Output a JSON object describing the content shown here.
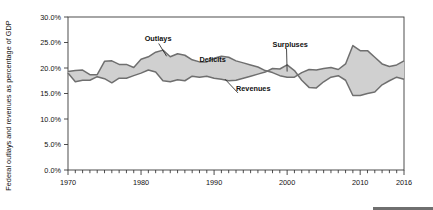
{
  "chart_data": {
    "type": "area",
    "title": "",
    "subtitle": "",
    "xlabel": "",
    "ylabel": "Federal outlays and revenues as percentage of GDP",
    "xlim": [
      1970,
      2016
    ],
    "ylim": [
      0.0,
      30.0
    ],
    "yticks": [
      "0.0%",
      "5.0%",
      "10.0%",
      "15.0%",
      "20.0%",
      "25.0%",
      "30.0%"
    ],
    "ytick_values": [
      0.0,
      5.0,
      10.0,
      15.0,
      20.0,
      25.0,
      30.0
    ],
    "xticks": [
      "1970",
      "1980",
      "1990",
      "2000",
      "2010",
      "2016"
    ],
    "xtick_values": [
      1970,
      1980,
      1990,
      2000,
      2010,
      2016
    ],
    "minor_tick_interval": 1,
    "grid": false,
    "legend": "none",
    "annotations": [
      {
        "text": "Outlays",
        "x": 1980.5,
        "y": 25.2,
        "leader_to_x": 1983.5,
        "leader_to_y": 22.3
      },
      {
        "text": "Deficits",
        "x": 1988.0,
        "y": 21.2,
        "leader": false
      },
      {
        "text": "Revenues",
        "x": 1993.0,
        "y": 15.5,
        "leader_to_x": 1991.5,
        "leader_to_y": 17.8
      },
      {
        "text": "Surpluses",
        "x": 1998.0,
        "y": 24.2,
        "leader_to_x": 2000.0,
        "leader_to_y": 19.3
      }
    ],
    "x": [
      1970,
      1971,
      1972,
      1973,
      1974,
      1975,
      1976,
      1977,
      1978,
      1979,
      1980,
      1981,
      1982,
      1983,
      1984,
      1985,
      1986,
      1987,
      1988,
      1989,
      1990,
      1991,
      1992,
      1993,
      1994,
      1995,
      1996,
      1997,
      1998,
      1999,
      2000,
      2001,
      2002,
      2003,
      2004,
      2005,
      2006,
      2007,
      2008,
      2009,
      2010,
      2011,
      2012,
      2013,
      2014,
      2015,
      2016
    ],
    "series": [
      {
        "name": "Outlays",
        "color": "#6f6f6f",
        "values": [
          19.3,
          19.5,
          19.6,
          18.7,
          18.7,
          21.3,
          21.4,
          20.7,
          20.7,
          20.1,
          21.7,
          22.2,
          23.1,
          23.5,
          22.2,
          22.8,
          22.5,
          21.6,
          21.2,
          21.2,
          21.9,
          22.3,
          22.1,
          21.4,
          21.0,
          20.6,
          20.2,
          19.5,
          19.1,
          18.5,
          18.2,
          18.2,
          19.1,
          19.7,
          19.6,
          19.9,
          20.1,
          19.7,
          20.8,
          24.4,
          23.4,
          23.4,
          22.1,
          20.8,
          20.3,
          20.6,
          21.4
        ]
      },
      {
        "name": "Revenues",
        "color": "#6f6f6f",
        "values": [
          19.0,
          17.3,
          17.6,
          17.6,
          18.3,
          17.9,
          17.1,
          18.0,
          18.0,
          18.5,
          19.0,
          19.6,
          19.2,
          17.5,
          17.3,
          17.7,
          17.5,
          18.4,
          18.2,
          18.4,
          18.0,
          17.8,
          17.5,
          17.6,
          18.0,
          18.4,
          18.8,
          19.2,
          19.9,
          19.8,
          20.6,
          19.5,
          17.6,
          16.2,
          16.1,
          17.3,
          18.2,
          18.5,
          17.6,
          14.6,
          14.6,
          15.0,
          15.3,
          16.7,
          17.5,
          18.2,
          17.8
        ]
      }
    ],
    "fill_color": "#d0d0d0"
  },
  "axis": {
    "y_title": "Federal outlays and revenues as percentage of GDP"
  }
}
